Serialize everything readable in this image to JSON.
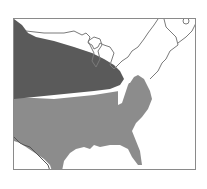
{
  "map": {
    "region": "Eastern United States",
    "frame_color": "#8a8a8a",
    "zones": [
      {
        "name": "northern-zone",
        "color": "#5a5a5a"
      },
      {
        "name": "southern-zone",
        "color": "#8c8c8c"
      }
    ],
    "outline_color": "#7a7a7a",
    "background": "#ffffff"
  }
}
